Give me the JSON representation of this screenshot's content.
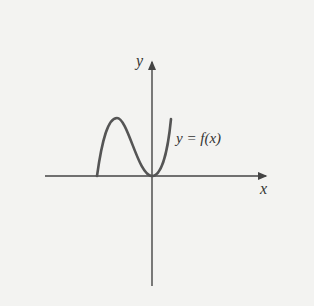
{
  "diagram": {
    "x_axis_label": "x",
    "y_axis_label": "y",
    "curve_label": "y = f(x)",
    "colors": {
      "background": "#f3f3f1",
      "axis": "#444444",
      "curve": "#555555",
      "text": "#333333"
    },
    "curve_points": [
      [
        97,
        176
      ],
      [
        117,
        118
      ],
      [
        152,
        176
      ],
      [
        171,
        119
      ]
    ]
  }
}
